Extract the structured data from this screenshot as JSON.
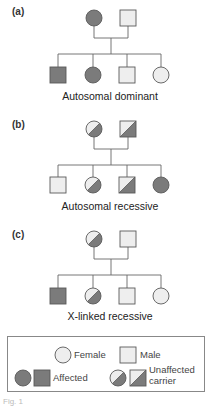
{
  "colors": {
    "affected": "#7b7b7b",
    "unaffected": "#eeeeee",
    "stroke": "#5a5a5a",
    "line": "#666666"
  },
  "panels": [
    {
      "label": "(a)",
      "caption": "Autosomal dominant",
      "parents": [
        {
          "sex": "female",
          "status": "affected"
        },
        {
          "sex": "male",
          "status": "unaffected"
        }
      ],
      "children": [
        {
          "sex": "male",
          "status": "affected"
        },
        {
          "sex": "female",
          "status": "affected"
        },
        {
          "sex": "male",
          "status": "unaffected"
        },
        {
          "sex": "female",
          "status": "unaffected"
        }
      ]
    },
    {
      "label": "(b)",
      "caption": "Autosomal recessive",
      "parents": [
        {
          "sex": "female",
          "status": "carrier"
        },
        {
          "sex": "male",
          "status": "carrier"
        }
      ],
      "children": [
        {
          "sex": "male",
          "status": "unaffected"
        },
        {
          "sex": "female",
          "status": "carrier"
        },
        {
          "sex": "male",
          "status": "carrier"
        },
        {
          "sex": "female",
          "status": "affected"
        }
      ]
    },
    {
      "label": "(c)",
      "caption": "X-linked recessive",
      "parents": [
        {
          "sex": "female",
          "status": "carrier"
        },
        {
          "sex": "male",
          "status": "unaffected"
        }
      ],
      "children": [
        {
          "sex": "male",
          "status": "affected"
        },
        {
          "sex": "female",
          "status": "carrier"
        },
        {
          "sex": "male",
          "status": "unaffected"
        },
        {
          "sex": "female",
          "status": "unaffected"
        }
      ]
    }
  ],
  "legend": {
    "female": "Female",
    "male": "Male",
    "affected": "Affected",
    "carrier_line1": "Unaffected",
    "carrier_line2": "carrier"
  },
  "figure_caption": "Fig. 1"
}
